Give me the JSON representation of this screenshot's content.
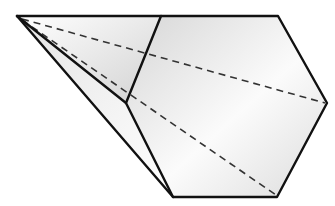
{
  "figure": {
    "apex": [
      17,
      16
    ],
    "base_vertices": [
      [
        161,
        16
      ],
      [
        278,
        16
      ],
      [
        327,
        103
      ],
      [
        277,
        197
      ],
      [
        173,
        197
      ],
      [
        126,
        103
      ]
    ],
    "hidden_edges": [
      [
        [
          17,
          16
        ],
        [
          327,
          103
        ]
      ],
      [
        [
          17,
          16
        ],
        [
          277,
          197
        ]
      ]
    ],
    "colors": {
      "edge": "#111111",
      "hidden_edge": "#333333",
      "face_light": "#ffffff",
      "face_shade": "#d9d9d9"
    }
  }
}
